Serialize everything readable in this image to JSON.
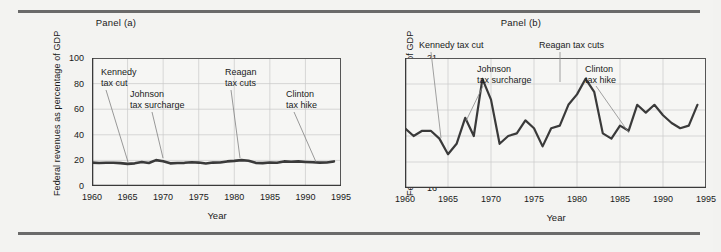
{
  "figure": {
    "background_color": "#f3f3f1",
    "rule_color": "#6a6a6a",
    "line_color": "#3a3a3a",
    "grid_color": "#c8c8c8",
    "axis_color": "#555555"
  },
  "panels": [
    {
      "id": "a",
      "title": "Panel (a)",
      "ylabel": "Federal revenues as percentage of GDP",
      "xlabel": "Year",
      "yticks": [
        "0",
        "20",
        "40",
        "60",
        "80",
        "100"
      ],
      "xticks": [
        "1960",
        "1965",
        "1970",
        "1975",
        "1980",
        "1985",
        "1990",
        "1995"
      ],
      "annotations": [
        {
          "name": "kennedy",
          "lines": [
            "Kennedy",
            "tax cut"
          ]
        },
        {
          "name": "johnson",
          "lines": [
            "Johnson",
            "tax surcharge"
          ]
        },
        {
          "name": "reagan",
          "lines": [
            "Reagan",
            "tax cuts"
          ]
        },
        {
          "name": "clinton",
          "lines": [
            "Clinton",
            "tax hike"
          ]
        }
      ]
    },
    {
      "id": "b",
      "title": "Panel (b)",
      "ylabel": "Federal revenues as percentage of GDP",
      "xlabel": "Year",
      "yticks": [
        "16",
        "17",
        "18",
        "19",
        "20",
        "21"
      ],
      "xticks": [
        "1960",
        "1965",
        "1970",
        "1975",
        "1980",
        "1985",
        "1990",
        "1995"
      ],
      "annotations": [
        {
          "name": "kennedy",
          "lines": [
            "Kennedy tax cut"
          ]
        },
        {
          "name": "johnson",
          "lines": [
            "Johnson",
            "tax surcharge"
          ]
        },
        {
          "name": "reagan",
          "lines": [
            "Reagan tax cuts"
          ]
        },
        {
          "name": "clinton",
          "lines": [
            "Clinton",
            "tax hike"
          ]
        }
      ]
    }
  ],
  "chart_data": [
    {
      "type": "line",
      "panel": "a",
      "title": "Panel (a)",
      "xlabel": "Year",
      "ylabel": "Federal revenues as percentage of GDP",
      "xlim": [
        1960,
        1995
      ],
      "ylim": [
        0,
        100
      ],
      "ytick_values": [
        0,
        20,
        40,
        60,
        80,
        100
      ],
      "xtick_values": [
        1960,
        1965,
        1970,
        1975,
        1980,
        1985,
        1990,
        1995
      ],
      "grid": true,
      "legend": "none",
      "x": [
        1960,
        1961,
        1962,
        1963,
        1964,
        1965,
        1966,
        1967,
        1968,
        1969,
        1970,
        1971,
        1972,
        1973,
        1974,
        1975,
        1976,
        1977,
        1978,
        1979,
        1980,
        1981,
        1982,
        1983,
        1984,
        1985,
        1986,
        1987,
        1988,
        1989,
        1990,
        1991,
        1992,
        1993,
        1994
      ],
      "values": [
        18.3,
        18.0,
        18.2,
        18.2,
        17.9,
        17.3,
        17.7,
        18.7,
        18.0,
        20.2,
        19.4,
        17.7,
        18.0,
        18.1,
        18.6,
        18.3,
        17.6,
        18.3,
        18.4,
        19.2,
        19.6,
        20.2,
        19.7,
        18.1,
        17.9,
        18.4,
        18.2,
        19.2,
        18.9,
        19.2,
        18.8,
        18.5,
        18.3,
        18.4,
        19.2
      ],
      "annotations": [
        {
          "text": "Kennedy tax cut",
          "year": 1964
        },
        {
          "text": "Johnson tax surcharge",
          "year": 1969
        },
        {
          "text": "Reagan tax cuts",
          "year": 1981
        },
        {
          "text": "Clinton tax hike",
          "year": 1993
        }
      ]
    },
    {
      "type": "line",
      "panel": "b",
      "title": "Panel (b)",
      "xlabel": "Year",
      "ylabel": "Federal revenues as percentage of GDP",
      "xlim": [
        1960,
        1995
      ],
      "ylim": [
        16,
        21
      ],
      "ytick_values": [
        16,
        17,
        18,
        19,
        20,
        21
      ],
      "xtick_values": [
        1960,
        1965,
        1970,
        1975,
        1980,
        1985,
        1990,
        1995
      ],
      "grid": true,
      "legend": "none",
      "x": [
        1960,
        1961,
        1962,
        1963,
        1964,
        1965,
        1966,
        1967,
        1968,
        1969,
        1970,
        1971,
        1972,
        1973,
        1974,
        1975,
        1976,
        1977,
        1978,
        1979,
        1980,
        1981,
        1982,
        1983,
        1984,
        1985,
        1986,
        1987,
        1988,
        1989,
        1990,
        1991,
        1992,
        1993,
        1994
      ],
      "values": [
        18.3,
        18.0,
        18.2,
        18.2,
        17.9,
        17.3,
        17.7,
        18.7,
        18.0,
        20.2,
        19.4,
        17.7,
        18.0,
        18.1,
        18.6,
        18.3,
        17.6,
        18.3,
        18.4,
        19.2,
        19.6,
        20.2,
        19.7,
        18.1,
        17.9,
        18.4,
        18.2,
        19.2,
        18.9,
        19.2,
        18.8,
        18.5,
        18.3,
        18.4,
        19.2
      ],
      "annotations": [
        {
          "text": "Kennedy tax cut",
          "year": 1964
        },
        {
          "text": "Johnson tax surcharge",
          "year": 1969
        },
        {
          "text": "Reagan tax cuts",
          "year": 1981
        },
        {
          "text": "Clinton tax hike",
          "year": 1993
        }
      ]
    }
  ]
}
